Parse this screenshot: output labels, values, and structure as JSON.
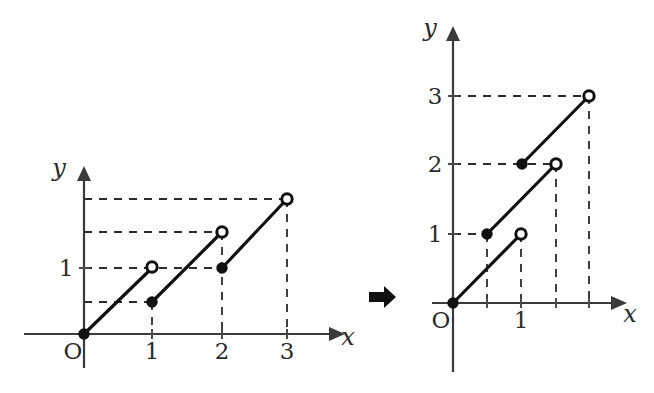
{
  "figure": {
    "background": "#ffffff",
    "ink": "#111111",
    "transition_arrow": "transform-arrow"
  },
  "left_panel": {
    "name": "left-graph",
    "axis_labels": {
      "x": "x",
      "y": "y",
      "origin": "O"
    },
    "x_ticks": [
      {
        "value": 1,
        "label": "1"
      },
      {
        "value": 2,
        "label": "2"
      },
      {
        "value": 3,
        "label": "3"
      }
    ],
    "y_ticks": [
      {
        "value": 1,
        "label": "1"
      }
    ],
    "y_gridline_values": [
      0.5,
      1,
      1.5,
      2
    ],
    "x_range": [
      0,
      3.6
    ],
    "y_range": [
      0,
      2.45
    ],
    "segments": [
      {
        "from": [
          0,
          0
        ],
        "to": [
          1,
          1
        ],
        "start_marker": "closed",
        "end_marker": "open"
      },
      {
        "from": [
          1,
          0.5
        ],
        "to": [
          2,
          1.5
        ],
        "start_marker": "closed",
        "end_marker": "open"
      },
      {
        "from": [
          2,
          1
        ],
        "to": [
          3,
          2
        ],
        "start_marker": "closed",
        "end_marker": "open"
      }
    ],
    "closed_points": [
      [
        0,
        0
      ],
      [
        1,
        0.5
      ],
      [
        2,
        1
      ]
    ],
    "open_points": [
      [
        1,
        1
      ],
      [
        2,
        1.5
      ],
      [
        3,
        2
      ]
    ],
    "dashed_drops": [
      [
        1,
        0.5
      ],
      [
        2,
        1.5
      ],
      [
        3,
        2
      ]
    ],
    "dashed_rails": [
      {
        "y": 0.5,
        "x_to": 1
      },
      {
        "y": 1,
        "x_to": 2
      },
      {
        "y": 1.5,
        "x_to": 2
      },
      {
        "y": 2,
        "x_to": 3
      }
    ]
  },
  "right_panel": {
    "name": "right-graph",
    "axis_labels": {
      "x": "x",
      "y": "y",
      "origin": "O"
    },
    "x_ticks": [
      {
        "value": 1,
        "label": "1"
      }
    ],
    "y_ticks": [
      {
        "value": 1,
        "label": "1"
      },
      {
        "value": 2,
        "label": "2"
      },
      {
        "value": 3,
        "label": "3"
      }
    ],
    "x_range": [
      0,
      2.6
    ],
    "y_range": [
      0,
      3.6
    ],
    "segments": [
      {
        "from": [
          0,
          0
        ],
        "to": [
          1,
          1
        ],
        "start_marker": "closed",
        "end_marker": "open"
      },
      {
        "from": [
          0.5,
          1
        ],
        "to": [
          1.5,
          2
        ],
        "start_marker": "closed",
        "end_marker": "open"
      },
      {
        "from": [
          1,
          2
        ],
        "to": [
          2,
          3
        ],
        "start_marker": "closed",
        "end_marker": "open"
      }
    ],
    "closed_points": [
      [
        0,
        0
      ],
      [
        0.5,
        1
      ],
      [
        1,
        2
      ]
    ],
    "open_points": [
      [
        1,
        1
      ],
      [
        1.5,
        2
      ],
      [
        2,
        3
      ]
    ],
    "dashed_drops": [
      [
        0.5,
        1
      ],
      [
        1,
        1
      ],
      [
        1.5,
        2
      ],
      [
        2,
        3
      ]
    ],
    "dashed_rails": [
      {
        "y": 1,
        "x_to": 0.5
      },
      {
        "y": 2,
        "x_to": 1.5
      },
      {
        "y": 3,
        "x_to": 2
      }
    ]
  }
}
